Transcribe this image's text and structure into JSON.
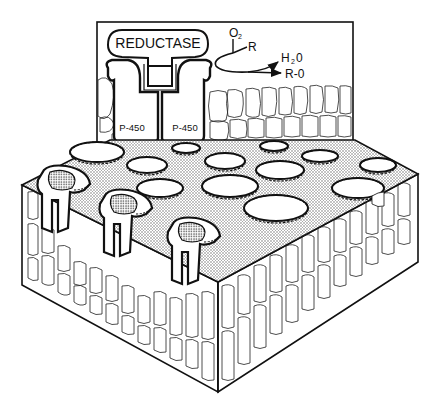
{
  "diagram": {
    "type": "scientific-illustration",
    "colors": {
      "ink": "#111111",
      "background": "#ffffff",
      "stipple": "#9a9a9a",
      "cell_fill": "#ffffff"
    },
    "inset": {
      "enzyme_label": "REDUCTASE",
      "subunit_left_label": "P-450",
      "subunit_right_label": "P-450",
      "reaction": {
        "oxygen": "O",
        "oxygen_sub": "2",
        "substrate": "R",
        "product_water": "H",
        "product_water_sub": "2",
        "product_water_tail": "0",
        "product_oxidized": "R-0"
      }
    },
    "block": {
      "description": "Isometric tissue block with stippled top surface, oval pores with beaded rims, and enzyme complexes embedded at the front edge",
      "pore_count": 14,
      "embedded_complex_count": 3
    }
  }
}
